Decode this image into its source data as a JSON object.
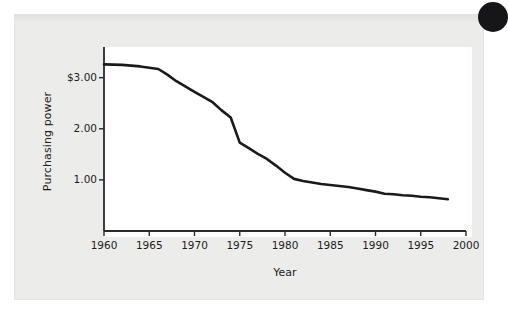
{
  "figure": {
    "corner_mark": "black-dot",
    "panel_color": "#ececeb",
    "plot_background": "#ffffff",
    "line_color": "#1a1a1a",
    "axis_color": "#2a2a2a",
    "text_color": "#1c1c1c"
  },
  "chart_data": {
    "type": "line",
    "title": "",
    "xlabel": "Year",
    "ylabel": "Purchasing power",
    "xlim": [
      1960,
      2000
    ],
    "ylim": [
      0,
      3.6
    ],
    "grid": false,
    "legend": null,
    "xticks": [
      1960,
      1965,
      1970,
      1975,
      1980,
      1985,
      1990,
      1995,
      2000
    ],
    "xticklabels": [
      "1960",
      "1965",
      "1970",
      "1975",
      "1980",
      "1985",
      "1990",
      "1995",
      "2000"
    ],
    "yticks": [
      1.0,
      2.0,
      3.0
    ],
    "yticklabels": [
      "1.00",
      "2.00",
      "$3.00"
    ],
    "series": [
      {
        "name": "Purchasing power of the dollar",
        "x": [
          1960,
          1962,
          1964,
          1966,
          1967,
          1968,
          1970,
          1972,
          1973,
          1974,
          1975,
          1976,
          1977,
          1978,
          1979,
          1980,
          1981,
          1982,
          1983,
          1984,
          1985,
          1986,
          1987,
          1988,
          1989,
          1990,
          1991,
          1992,
          1993,
          1994,
          1995,
          1996,
          1997,
          1998
        ],
        "y": [
          3.26,
          3.25,
          3.22,
          3.17,
          3.06,
          2.93,
          2.72,
          2.52,
          2.36,
          2.22,
          1.73,
          1.62,
          1.51,
          1.41,
          1.28,
          1.14,
          1.02,
          0.98,
          0.95,
          0.92,
          0.9,
          0.88,
          0.86,
          0.83,
          0.8,
          0.77,
          0.73,
          0.72,
          0.7,
          0.69,
          0.67,
          0.66,
          0.64,
          0.62
        ]
      }
    ]
  }
}
